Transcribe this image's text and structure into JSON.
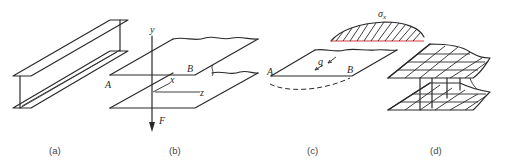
{
  "figure": {
    "panels": [
      {
        "id": "a",
        "caption": "(a)",
        "description": "I-beam in perspective"
      },
      {
        "id": "b",
        "caption": "(b)",
        "description": "Flange plates with axes and applied load",
        "labels": {
          "A": "A",
          "B": "B",
          "x": "x",
          "y": "y",
          "z": "z",
          "F": "F"
        }
      },
      {
        "id": "c",
        "caption": "(c)",
        "description": "Free-body of flange with shear flow",
        "labels": {
          "A": "A",
          "B": "B",
          "q": "q"
        }
      },
      {
        "id": "d",
        "caption": "(d)",
        "description": "Bending stress distribution across flange",
        "labels": {
          "sigma": "σ",
          "sigma_sub": "x"
        }
      }
    ],
    "colors": {
      "line": "#2a2a2a",
      "stress_baseline": "#d23a3a",
      "caption": "#444444"
    }
  }
}
